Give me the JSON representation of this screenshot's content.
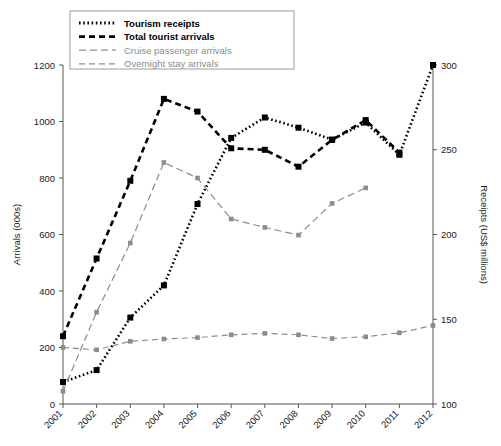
{
  "figure": {
    "caption": ""
  },
  "axes": {
    "y_left": {
      "label": "Arrivals (000s)",
      "ticks": [
        0,
        200,
        400,
        600,
        800,
        1000,
        1200
      ],
      "min": 0,
      "max": 1200
    },
    "y_right": {
      "label": "Receipts (US$ millions)",
      "ticks": [
        100,
        150,
        200,
        250,
        300
      ],
      "min": 100,
      "max": 300
    },
    "x": {
      "label": "",
      "ticks": [
        "2001",
        "2002",
        "2003",
        "2004",
        "2005",
        "2006",
        "2007",
        "2008",
        "2009",
        "2010",
        "2011",
        "2012"
      ]
    }
  },
  "legend": {
    "position": "top-left",
    "items": [
      {
        "label": "Tourism receipts",
        "style": "dotted",
        "color": "#000000",
        "weight": "bold"
      },
      {
        "label": "Total tourist arrivals",
        "style": "dashed",
        "color": "#000000",
        "weight": "bold"
      },
      {
        "label": "Cruise passenger arrivals",
        "style": "dashed-long",
        "color": "#8c8c8c",
        "weight": "normal"
      },
      {
        "label": "Overnight stay arrivals",
        "style": "dashed",
        "color": "#8c8c8c",
        "weight": "normal"
      }
    ]
  },
  "colors": {
    "black": "#000000",
    "gray": "#8c8c8c",
    "axis": "#555555",
    "background": "#ffffff"
  },
  "chart_data": {
    "type": "line",
    "title": "",
    "xlabel": "",
    "ylabel": "Arrivals (000s)",
    "y2label": "Receipts (US$ millions)",
    "grid": false,
    "legend_position": "top-left",
    "x": [
      "2001",
      "2002",
      "2003",
      "2004",
      "2005",
      "2006",
      "2007",
      "2008",
      "2009",
      "2010",
      "2011",
      "2012"
    ],
    "ylim": [
      0,
      1200
    ],
    "y2lim": [
      100,
      300
    ],
    "series": [
      {
        "name": "Tourism receipts",
        "axis": "right",
        "unit": "US$ millions",
        "style": "dotted",
        "color": "#000000",
        "values": [
          113,
          120,
          151,
          170,
          218,
          257,
          269,
          263,
          256,
          266,
          247,
          300
        ]
      },
      {
        "name": "Total tourist arrivals",
        "axis": "left",
        "unit": "000s",
        "style": "dashed",
        "color": "#000000",
        "values": [
          240,
          515,
          790,
          1080,
          1035,
          905,
          900,
          840,
          935,
          1005,
          890,
          null
        ]
      },
      {
        "name": "Cruise passenger arrivals",
        "axis": "left",
        "unit": "000s",
        "style": "dashed-long",
        "color": "#8c8c8c",
        "values": [
          45,
          325,
          570,
          855,
          800,
          655,
          625,
          598,
          710,
          765,
          null,
          null
        ]
      },
      {
        "name": "Overnight stay arrivals",
        "axis": "left",
        "unit": "000s",
        "style": "dashed",
        "color": "#8c8c8c",
        "values": [
          200,
          192,
          222,
          230,
          235,
          245,
          250,
          245,
          232,
          238,
          252,
          278
        ]
      }
    ]
  }
}
